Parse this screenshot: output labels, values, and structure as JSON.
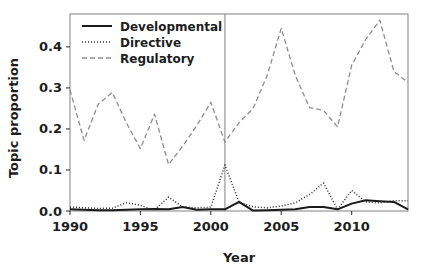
{
  "chart_data": {
    "type": "line",
    "title": "",
    "xlabel": "Year",
    "ylabel": "Topic proportion",
    "xlim": [
      1990,
      2014
    ],
    "ylim": [
      0.0,
      0.48
    ],
    "xticks": [
      1990,
      1995,
      2000,
      2005,
      2010
    ],
    "xtick_labels": [
      "1990",
      "1995",
      "2000",
      "2005",
      "2010"
    ],
    "yticks": [
      0.0,
      0.1,
      0.2,
      0.3,
      0.4
    ],
    "ytick_labels": [
      "0.0",
      "0.1",
      "0.2",
      "0.3",
      "0.4"
    ],
    "grid": false,
    "legend_position": "top-left",
    "x": [
      1990,
      1991,
      1992,
      1993,
      1994,
      1995,
      1996,
      1997,
      1998,
      1999,
      2000,
      2001,
      2002,
      2003,
      2004,
      2005,
      2006,
      2007,
      2008,
      2009,
      2010,
      2011,
      2012,
      2013,
      2014
    ],
    "series": [
      {
        "name": "Developmental",
        "style": "solid",
        "color": "#1a1a1a",
        "values": [
          0.004,
          0.003,
          0.002,
          0.002,
          0.003,
          0.004,
          0.005,
          0.004,
          0.01,
          0.003,
          0.004,
          0.004,
          0.022,
          0.001,
          0.002,
          0.003,
          0.004,
          0.01,
          0.01,
          0.004,
          0.018,
          0.026,
          0.024,
          0.022,
          0.004
        ]
      },
      {
        "name": "Directive",
        "style": "dotted",
        "color": "#2b2b2b",
        "values": [
          0.01,
          0.008,
          0.006,
          0.007,
          0.02,
          0.014,
          0.002,
          0.034,
          0.01,
          0.008,
          0.009,
          0.112,
          0.022,
          0.01,
          0.008,
          0.012,
          0.02,
          0.04,
          0.068,
          0.004,
          0.05,
          0.022,
          0.02,
          0.025,
          0.025
        ]
      },
      {
        "name": "Regulatory",
        "style": "dashed",
        "color": "#8d8d8d",
        "values": [
          0.295,
          0.172,
          0.26,
          0.289,
          0.215,
          0.152,
          0.236,
          0.113,
          0.158,
          0.208,
          0.265,
          0.168,
          0.215,
          0.25,
          0.33,
          0.445,
          0.33,
          0.252,
          0.245,
          0.205,
          0.355,
          0.418,
          0.465,
          0.34,
          0.313
        ]
      }
    ],
    "annotations": [
      {
        "type": "vline",
        "name": "reference-line-2001",
        "x": 2001,
        "color": "#8d8d8d"
      }
    ]
  },
  "legend": {
    "items": [
      {
        "label": "Developmental"
      },
      {
        "label": "Directive"
      },
      {
        "label": "Regulatory"
      }
    ]
  }
}
